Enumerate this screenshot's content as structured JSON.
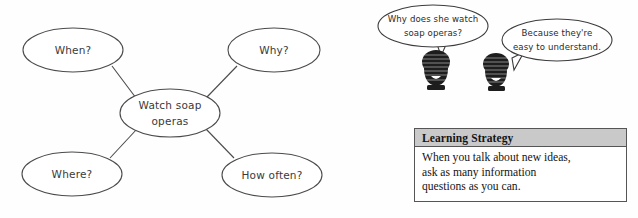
{
  "page": {
    "background_color": "#fefefe",
    "width": 638,
    "height": 218
  },
  "mind_map": {
    "name": "soap-opera-mind-map",
    "center": {
      "label_line1": "Watch soap",
      "label_line2": "operas",
      "cx": 170,
      "cy": 113,
      "rx": 50,
      "ry": 24
    },
    "nodes": [
      {
        "id": "when",
        "label": "When?",
        "cx": 73,
        "cy": 50,
        "rx": 50,
        "ry": 22
      },
      {
        "id": "why",
        "label": "Why?",
        "cx": 274,
        "cy": 50,
        "rx": 46,
        "ry": 22
      },
      {
        "id": "where",
        "label": "Where?",
        "cx": 72,
        "cy": 174,
        "rx": 50,
        "ry": 22
      },
      {
        "id": "how-often",
        "label": "How often?",
        "cx": 272,
        "cy": 175,
        "rx": 50,
        "ry": 22
      }
    ],
    "connectors": [
      {
        "id": "when-to-center",
        "x1": 112,
        "y1": 66,
        "x2": 136,
        "y2": 98
      },
      {
        "id": "why-to-center",
        "x1": 237,
        "y1": 66,
        "x2": 207,
        "y2": 97
      },
      {
        "id": "where-to-center",
        "x1": 110,
        "y1": 158,
        "x2": 137,
        "y2": 129
      },
      {
        "id": "how-often-to-center",
        "x1": 234,
        "y1": 158,
        "x2": 206,
        "y2": 129
      }
    ]
  },
  "dialogue": {
    "name": "conversation-illustration",
    "bubbles": [
      {
        "id": "question-bubble",
        "line1": "Why does she watch",
        "line2": "soap operas?",
        "cx": 433,
        "cy": 26,
        "rx": 55,
        "ry": 21
      },
      {
        "id": "answer-bubble",
        "line1": "Because they're",
        "line2": "easy to understand.",
        "cx": 557,
        "cy": 40,
        "rx": 55,
        "ry": 21
      }
    ],
    "figures": [
      {
        "id": "speaker-left",
        "cx": 438,
        "cy": 70
      },
      {
        "id": "speaker-right",
        "cx": 498,
        "cy": 72
      }
    ]
  },
  "strategy_box": {
    "name": "learning-strategy-box",
    "header_title": "Learning Strategy",
    "header_color": "#c9c9c9",
    "border_color": "#555555",
    "body_lines": [
      "When you talk about new ideas,",
      "ask as many information",
      "questions as you can."
    ]
  }
}
